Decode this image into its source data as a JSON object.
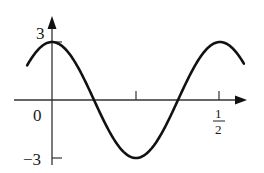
{
  "chart_data": {
    "type": "line",
    "title": "",
    "xlabel": "",
    "ylabel": "",
    "function": "y = 3 cos(4 pi t)",
    "amplitude": 3,
    "period": 0.5,
    "xlim": [
      -0.074,
      0.571
    ],
    "ylim": [
      -3,
      3
    ],
    "grid": false,
    "legend": null,
    "x_ticks": [
      {
        "value": 0,
        "label": "0"
      },
      {
        "value": 0.25,
        "label": ""
      },
      {
        "value": 0.5,
        "label": "1/2"
      }
    ],
    "y_ticks": [
      {
        "value": 3,
        "label": "3"
      },
      {
        "value": -3,
        "label": "−3"
      }
    ],
    "series": [
      {
        "name": "signal",
        "x": [
          -0.074,
          0,
          0.0625,
          0.125,
          0.1875,
          0.25,
          0.3125,
          0.375,
          0.4375,
          0.5,
          0.571
        ],
        "values": [
          1.79,
          3,
          2.12,
          0,
          -2.12,
          -3,
          -2.12,
          0,
          2.12,
          3,
          1.87
        ]
      }
    ],
    "annotations": []
  },
  "labels": {
    "y_top": "3",
    "y_bottom": "−3",
    "origin": "0",
    "x_half_num": "1",
    "x_half_den": "2"
  },
  "colors": {
    "curve": "#111111",
    "axes": "#333333",
    "background": "#ffffff"
  }
}
